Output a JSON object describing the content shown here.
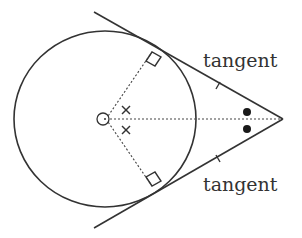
{
  "diagram": {
    "labels": {
      "upper_tangent": "tangent",
      "lower_tangent": "tangent"
    },
    "colors": {
      "stroke": "#333333",
      "background": "#ffffff"
    },
    "geometry": {
      "circle_center": [
        105,
        119
      ],
      "circle_radius_x": 91,
      "circle_radius_y": 88,
      "external_point": [
        283,
        119
      ],
      "upper_tangent_point": [
        155,
        50
      ],
      "lower_tangent_point": [
        155,
        188
      ],
      "upper_tangent_line": [
        [
          94,
          12
        ],
        [
          283,
          119
        ]
      ],
      "lower_tangent_line": [
        [
          94,
          228
        ],
        [
          283,
          119
        ]
      ]
    },
    "markings": {
      "right_angles": [
        "upper_tangent_point",
        "lower_tangent_point"
      ],
      "equal_length_ticks": [
        "upper_tangent_segment",
        "lower_tangent_segment"
      ],
      "equal_angles_at_center": "cross-marks",
      "equal_angles_at_external_point": "dots"
    }
  }
}
